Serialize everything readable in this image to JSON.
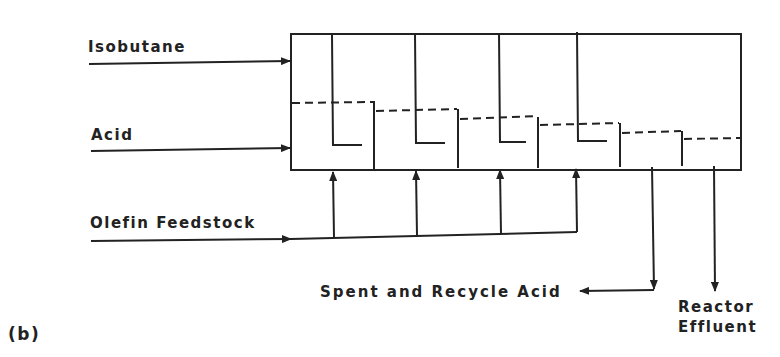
{
  "diagram": {
    "figure_label": "(b)",
    "inputs": {
      "isobutane": "Isobutane",
      "acid": "Acid",
      "olefin": "Olefin Feedstock"
    },
    "outputs": {
      "spent_acid": "Spent and Recycle Acid",
      "effluent_line1": "Reactor",
      "effluent_line2": "Effluent"
    },
    "stages": 4,
    "settler_compartments": 2,
    "colors": {
      "line": "#222222",
      "background": "#ffffff"
    }
  }
}
